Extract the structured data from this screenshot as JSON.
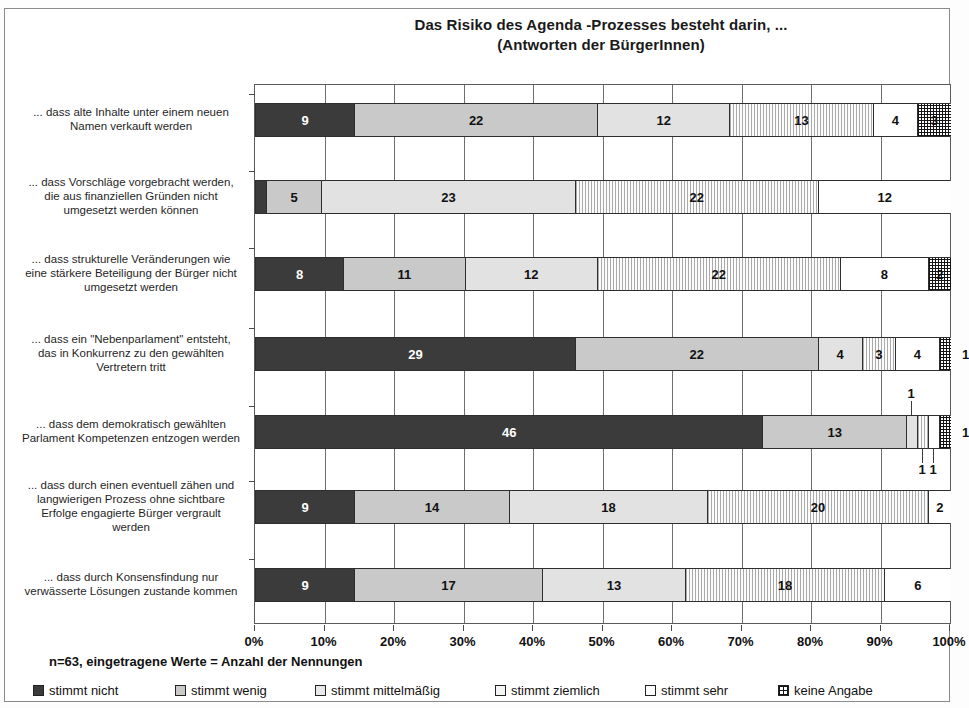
{
  "title": {
    "line1": "Das Risiko des Agenda -Prozesses besteht darin, ...",
    "line2": "(Antworten der BürgerInnen)"
  },
  "footnote": "n=63, eingetragene Werte = Anzahl der Nennungen",
  "axis": {
    "ticks": [
      "0%",
      "10%",
      "20%",
      "30%",
      "40%",
      "50%",
      "60%",
      "70%",
      "80%",
      "90%",
      "100%"
    ]
  },
  "legend": [
    {
      "label": "stimmt nicht",
      "swatch": "dark-gray-solid"
    },
    {
      "label": "stimmt wenig",
      "swatch": "medium-gray-solid"
    },
    {
      "label": "stimmt mittelmäßig",
      "swatch": "light-gray-solid"
    },
    {
      "label": "stimmt ziemlich",
      "swatch": "dotted-pattern"
    },
    {
      "label": "stimmt sehr",
      "swatch": "white-solid"
    },
    {
      "label": "keine Angabe",
      "swatch": "crosshatch-pattern"
    }
  ],
  "chart_data": {
    "type": "bar",
    "orientation": "horizontal",
    "stacked": true,
    "normalized": true,
    "title": "Das Risiko des Agenda -Prozesses besteht darin, ... (Antworten der BürgerInnen)",
    "xlabel": "",
    "ylabel": "",
    "xlim": [
      0,
      100
    ],
    "xunit": "%",
    "n": 63,
    "value_meaning": "Anzahl der Nennungen",
    "grid": true,
    "legend_position": "bottom",
    "categories": [
      "... dass alte Inhalte unter einem neuen Namen verkauft werden",
      "... dass Vorschläge vorgebracht werden, die aus finanziellen Gründen nicht umgesetzt werden können",
      "... dass strukturelle Veränderungen wie eine stärkere Beteiligung der Bürger nicht umgesetzt werden",
      "... dass ein \"Nebenparlament\" entsteht, das in Konkurrenz zu den gewählten Vertretern tritt",
      "... dass dem demokratisch gewählten Parlament Kompetenzen entzogen werden",
      "... dass durch einen eventuell zähen und langwierigen Prozess ohne sichtbare Erfolge engagierte Bürger vergrault werden",
      "... dass durch Konsensfindung nur verwässerte Lösungen zustande kommen"
    ],
    "category_lines": [
      [
        "... dass alte Inhalte unter einem neuen",
        "Namen verkauft werden"
      ],
      [
        "... dass Vorschläge vorgebracht werden,",
        "die aus finanziellen Gründen nicht",
        "umgesetzt werden können"
      ],
      [
        "... dass strukturelle Veränderungen wie",
        "eine stärkere Beteiligung der Bürger nicht",
        "umgesetzt werden"
      ],
      [
        "... dass ein \"Nebenparlament\" entsteht,",
        "das in Konkurrenz zu den gewählten",
        "Vertretern tritt"
      ],
      [
        "... dass dem demokratisch gewählten",
        "Parlament Kompetenzen entzogen werden"
      ],
      [
        "... dass durch einen eventuell zähen und",
        "langwierigen Prozess ohne sichtbare",
        "Erfolge engagierte Bürger vergrault",
        "werden"
      ],
      [
        "... dass durch Konsensfindung nur",
        "verwässerte Lösungen zustande kommen"
      ]
    ],
    "series": [
      {
        "name": "stimmt nicht",
        "values": [
          9,
          1,
          8,
          29,
          46,
          9,
          9
        ]
      },
      {
        "name": "stimmt wenig",
        "values": [
          22,
          5,
          11,
          22,
          13,
          14,
          17
        ]
      },
      {
        "name": "stimmt mittelmäßig",
        "values": [
          12,
          23,
          12,
          4,
          1,
          18,
          13
        ]
      },
      {
        "name": "stimmt ziemlich",
        "values": [
          13,
          22,
          22,
          3,
          1,
          20,
          18
        ]
      },
      {
        "name": "stimmt sehr",
        "values": [
          4,
          12,
          8,
          4,
          1,
          2,
          6
        ]
      },
      {
        "name": "keine Angabe",
        "values": [
          3,
          0,
          2,
          1,
          1,
          0,
          0
        ]
      }
    ],
    "rows": [
      {
        "label_index": 0,
        "values": [
          9,
          22,
          12,
          13,
          4,
          3
        ],
        "total": 63
      },
      {
        "label_index": 1,
        "values": [
          1,
          5,
          23,
          22,
          12,
          0
        ],
        "total": 63
      },
      {
        "label_index": 2,
        "values": [
          8,
          11,
          12,
          22,
          8,
          2
        ],
        "total": 63
      },
      {
        "label_index": 3,
        "values": [
          29,
          22,
          4,
          3,
          4,
          1
        ],
        "total": 63
      },
      {
        "label_index": 4,
        "values": [
          46,
          13,
          1,
          1,
          1,
          1
        ],
        "total": 63
      },
      {
        "label_index": 5,
        "values": [
          9,
          14,
          18,
          20,
          2,
          0
        ],
        "total": 63
      },
      {
        "label_index": 6,
        "values": [
          9,
          17,
          13,
          18,
          6,
          0
        ],
        "total": 63
      }
    ]
  }
}
